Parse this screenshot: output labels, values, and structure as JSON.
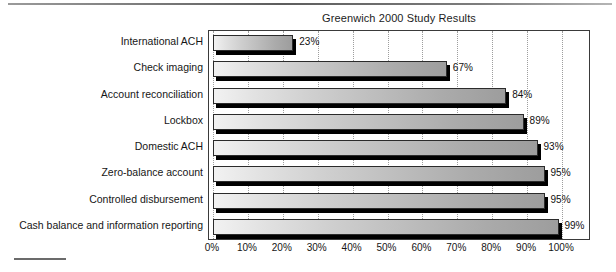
{
  "document": {
    "top_rule": "horizontal-rule",
    "bottom_rule": "horizontal-rule"
  },
  "chart_data": {
    "type": "bar",
    "orientation": "horizontal",
    "title": "Greenwich 2000 Study Results",
    "xlabel": "",
    "ylabel": "",
    "xlim": [
      0,
      100
    ],
    "grid": true,
    "grid_axis": "x",
    "legend": false,
    "categories": [
      "International ACH",
      "Check imaging",
      "Account reconciliation",
      "Lockbox",
      "Domestic ACH",
      "Zero-balance account",
      "Controlled disbursement",
      "Cash balance and information reporting"
    ],
    "values": [
      23,
      67,
      84,
      89,
      93,
      95,
      95,
      99
    ],
    "value_labels": [
      "23%",
      "67%",
      "84%",
      "89%",
      "93%",
      "95%",
      "95%",
      "99%"
    ],
    "xticks": [
      0,
      10,
      20,
      30,
      40,
      50,
      60,
      70,
      80,
      90,
      100
    ],
    "xtick_labels": [
      "0%",
      "10%",
      "20%",
      "30%",
      "40%",
      "50%",
      "60%",
      "70%",
      "80%",
      "90%",
      "100%"
    ],
    "colors": {
      "bar_gradient_start": "#f2f2f2",
      "bar_gradient_end": "#9d9d9d",
      "bar_outline": "#2b2b2b",
      "bar_shadow": "#000000",
      "plot_border": "#3a3a3a",
      "gridline": "#9d9d9d",
      "text": "#161616",
      "background": "#ffffff"
    }
  }
}
